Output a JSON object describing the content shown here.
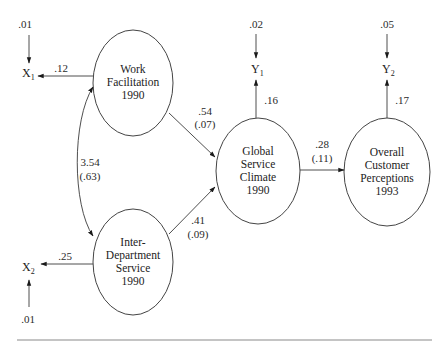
{
  "diagram": {
    "type": "structural-equation-path-diagram",
    "nodes": {
      "work_facilitation": {
        "line1": "Work",
        "line2": "Facilitation",
        "line3": "1990"
      },
      "inter_department": {
        "line1": "Inter-",
        "line2": "Department",
        "line3": "Service",
        "line4": "1990"
      },
      "global_climate": {
        "line1": "Global",
        "line2": "Service",
        "line3": "Climate",
        "line4": "1990"
      },
      "customer_perceptions": {
        "line1": "Overall",
        "line2": "Customer",
        "line3": "Perceptions",
        "line4": "1993"
      }
    },
    "indicators": {
      "x1": {
        "letter": "X",
        "sub": "1",
        "error": ".01",
        "loading": ".12"
      },
      "x2": {
        "letter": "X",
        "sub": "2",
        "error": ".01",
        "loading": ".25"
      },
      "y1": {
        "letter": "Y",
        "sub": "1",
        "error": ".02",
        "loading": ".16"
      },
      "y2": {
        "letter": "Y",
        "sub": "2",
        "error": ".05",
        "loading": ".17"
      }
    },
    "paths": {
      "wf_to_gsc": {
        "coef": ".54",
        "se": "(.07)"
      },
      "ids_to_gsc": {
        "coef": ".41",
        "se": "(.09)"
      },
      "gsc_to_ocp": {
        "coef": ".28",
        "se": "(.11)"
      },
      "wf_ids_covariance": {
        "coef": "3.54",
        "se": "(.63)"
      }
    },
    "colors": {
      "line": "#3a3a3a",
      "text": "#222222",
      "rule": "#8a8a8a",
      "background": "#ffffff"
    }
  }
}
